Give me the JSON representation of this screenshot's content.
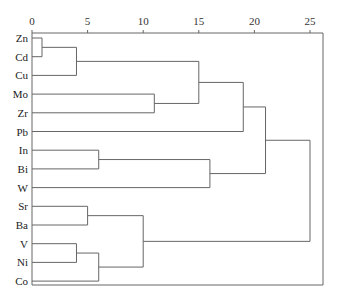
{
  "chart_data": {
    "type": "dendrogram",
    "title": "",
    "xlabel": "",
    "ylabel": "",
    "xlim": [
      0,
      26.2
    ],
    "ticks": [
      0,
      5,
      10,
      15,
      20,
      25
    ],
    "leaves": [
      "Zn",
      "Cd",
      "Cu",
      "Mo",
      "Zr",
      "Pb",
      "In",
      "Bi",
      "W",
      "Sr",
      "Ba",
      "V",
      "Ni",
      "Co"
    ],
    "merges": [
      {
        "a": "Zn",
        "b": "Cd",
        "distance": 0.9,
        "id": "c1"
      },
      {
        "a": "c1",
        "b": "Cu",
        "distance": 4,
        "id": "c2"
      },
      {
        "a": "Mo",
        "b": "Zr",
        "distance": 11,
        "id": "c3"
      },
      {
        "a": "c2",
        "b": "c3",
        "distance": 15,
        "id": "c4"
      },
      {
        "a": "c4",
        "b": "Pb",
        "distance": 19,
        "id": "c5"
      },
      {
        "a": "In",
        "b": "Bi",
        "distance": 6,
        "id": "c6"
      },
      {
        "a": "c6",
        "b": "W",
        "distance": 16,
        "id": "c7"
      },
      {
        "a": "c5",
        "b": "c7",
        "distance": 21,
        "id": "c8"
      },
      {
        "a": "Sr",
        "b": "Ba",
        "distance": 5,
        "id": "c9"
      },
      {
        "a": "V",
        "b": "Ni",
        "distance": 4,
        "id": "c10"
      },
      {
        "a": "c10",
        "b": "Co",
        "distance": 6,
        "id": "c11"
      },
      {
        "a": "c9",
        "b": "c11",
        "distance": 10,
        "id": "c12"
      },
      {
        "a": "c8",
        "b": "c12",
        "distance": 25,
        "id": "c13"
      }
    ],
    "grid": false,
    "legend": null
  },
  "colors": {
    "line": "#666666",
    "text": "#222222"
  }
}
